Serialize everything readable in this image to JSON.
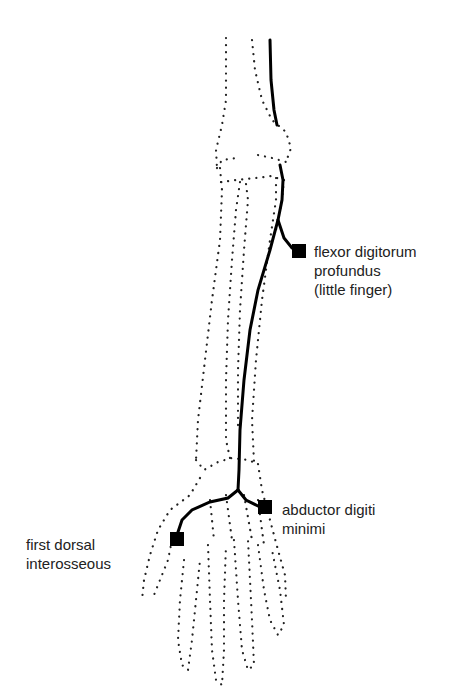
{
  "diagram": {
    "labels": [
      {
        "id": "fdp",
        "lines": [
          "flexor digitorum",
          "profundus",
          "(little finger)"
        ]
      },
      {
        "id": "adm",
        "lines": [
          "abductor digiti",
          "minimi"
        ]
      },
      {
        "id": "fdi",
        "lines": [
          "first dorsal",
          "interosseous"
        ]
      }
    ],
    "colors": {
      "nerve": "#000000",
      "outline": "#222222",
      "background": "#ffffff"
    }
  }
}
